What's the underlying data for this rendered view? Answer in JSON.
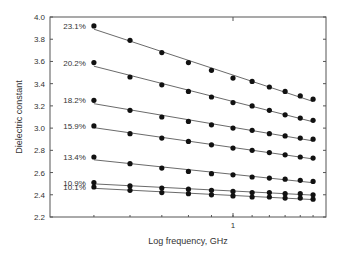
{
  "chart_data": {
    "type": "scatter",
    "title": "",
    "xlabel": "Log frequency, GHz",
    "ylabel": "Dielectric constant",
    "xscale": "log",
    "ylim": [
      2.2,
      4.0
    ],
    "yticks": [
      2.2,
      2.4,
      2.6,
      2.8,
      3.0,
      3.2,
      3.4,
      3.6,
      3.8,
      4.0
    ],
    "ytick_labels": [
      "2.2",
      "2.4",
      "2.6",
      "2.8",
      "3.0",
      "3.2",
      "3.4",
      "3.6",
      "3.8",
      "4.0"
    ],
    "xtick_labels": [
      "1"
    ],
    "xticks": [
      1
    ],
    "grid": false,
    "legend": "inline labels at left of each series",
    "markers": "filled circles with linear fit lines",
    "x": [
      0.3,
      0.41,
      0.54,
      0.68,
      0.83,
      1.0,
      1.18,
      1.37,
      1.57,
      1.79,
      2.0
    ],
    "series": [
      {
        "name": "23.1%",
        "values": [
          3.92,
          3.79,
          3.68,
          3.59,
          3.52,
          3.45,
          3.42,
          3.37,
          3.33,
          3.29,
          3.26
        ]
      },
      {
        "name": "20.2%",
        "values": [
          3.59,
          3.46,
          3.39,
          3.33,
          3.28,
          3.23,
          3.2,
          3.16,
          3.12,
          3.09,
          3.07
        ]
      },
      {
        "name": "18.2%",
        "values": [
          3.25,
          3.16,
          3.1,
          3.06,
          3.03,
          3.0,
          2.98,
          2.95,
          2.93,
          2.91,
          2.9
        ]
      },
      {
        "name": "15.9%",
        "values": [
          3.02,
          2.95,
          2.91,
          2.88,
          2.85,
          2.82,
          2.8,
          2.78,
          2.76,
          2.74,
          2.73
        ]
      },
      {
        "name": "13.4%",
        "values": [
          2.74,
          2.68,
          2.64,
          2.61,
          2.59,
          2.58,
          2.56,
          2.55,
          2.54,
          2.53,
          2.52
        ]
      },
      {
        "name": "10.9%",
        "values": [
          2.51,
          2.48,
          2.46,
          2.45,
          2.44,
          2.43,
          2.42,
          2.42,
          2.41,
          2.41,
          2.4
        ]
      },
      {
        "name": "10.1%",
        "values": [
          2.47,
          2.44,
          2.42,
          2.41,
          2.4,
          2.39,
          2.38,
          2.38,
          2.37,
          2.37,
          2.36
        ]
      }
    ]
  },
  "colors": {
    "frame": "#555555",
    "marker": "#111111",
    "fit_line": "#444444",
    "text": "#333333"
  }
}
